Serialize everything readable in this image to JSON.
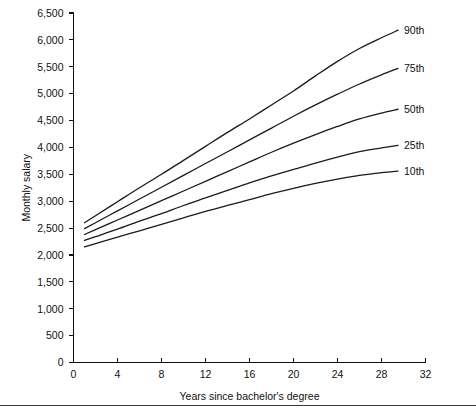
{
  "chart_data": {
    "type": "line",
    "title": "",
    "subtitle": "",
    "xlabel": "Years since bachelor's degree",
    "ylabel": "Monthly salary",
    "xlim": [
      0,
      32
    ],
    "ylim": [
      0,
      6500
    ],
    "x_ticks": [
      0,
      4,
      8,
      12,
      16,
      20,
      24,
      28,
      32
    ],
    "x_tick_labels": [
      "0",
      "4",
      "8",
      "12",
      "16",
      "20",
      "24",
      "28",
      "32"
    ],
    "y_ticks": [
      0,
      500,
      1000,
      1500,
      2000,
      2500,
      3000,
      3500,
      4000,
      4500,
      5000,
      5500,
      6000,
      6500
    ],
    "y_tick_labels": [
      "0",
      "500",
      "1,000",
      "1,500",
      "2,000",
      "2,500",
      "3,000",
      "3,500",
      "4,000",
      "4,500",
      "5,000",
      "5,500",
      "6,000",
      "6,500"
    ],
    "grid": false,
    "legend_position": "right-inline-labels",
    "x": [
      1,
      2,
      4,
      6,
      8,
      10,
      12,
      14,
      16,
      18,
      20,
      22,
      24,
      26,
      28,
      29.5
    ],
    "series": [
      {
        "name": "90th",
        "label": "90th",
        "values": [
          2600,
          2730,
          2990,
          3250,
          3500,
          3760,
          4020,
          4280,
          4530,
          4790,
          5050,
          5330,
          5600,
          5840,
          6040,
          6180
        ]
      },
      {
        "name": "75th",
        "label": "75th",
        "values": [
          2490,
          2600,
          2820,
          3040,
          3260,
          3480,
          3700,
          3920,
          4140,
          4360,
          4580,
          4790,
          4990,
          5180,
          5350,
          5470
        ]
      },
      {
        "name": "50th",
        "label": "50th",
        "values": [
          2380,
          2470,
          2650,
          2830,
          3010,
          3190,
          3370,
          3550,
          3730,
          3910,
          4080,
          4240,
          4390,
          4530,
          4640,
          4710
        ]
      },
      {
        "name": "25th",
        "label": "25th",
        "values": [
          2270,
          2340,
          2480,
          2630,
          2770,
          2920,
          3060,
          3200,
          3340,
          3470,
          3590,
          3710,
          3820,
          3920,
          3990,
          4040
        ]
      },
      {
        "name": "10th",
        "label": "10th",
        "values": [
          2150,
          2210,
          2330,
          2450,
          2570,
          2690,
          2810,
          2920,
          3030,
          3140,
          3240,
          3330,
          3410,
          3480,
          3530,
          3560
        ]
      }
    ],
    "series_label_y": [
      6180,
      5470,
      4710,
      4040,
      3560
    ],
    "axis_color": "#111111",
    "line_color": "#1a1a1a",
    "background": "#ffffff"
  }
}
